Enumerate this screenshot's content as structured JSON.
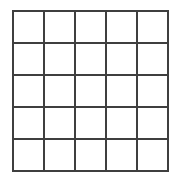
{
  "figure": {
    "name": "grid-figure",
    "type": "grid",
    "background_color": "#ffffff"
  },
  "chart_data": {
    "type": "table",
    "title": "",
    "subtitle": "",
    "xlabel": "",
    "ylabel": "",
    "rows": 5,
    "columns": 5,
    "cell_count": 25,
    "cell_values": [
      [
        "",
        "",
        "",
        "",
        ""
      ],
      [
        "",
        "",
        "",
        "",
        ""
      ],
      [
        "",
        "",
        "",
        "",
        ""
      ],
      [
        "",
        "",
        "",
        "",
        ""
      ],
      [
        "",
        "",
        "",
        "",
        ""
      ]
    ],
    "column_headers": [
      "",
      "",
      "",
      "",
      ""
    ],
    "row_headers": [
      "",
      "",
      "",
      "",
      ""
    ],
    "grid": "on",
    "legend": "none",
    "annotations": []
  },
  "geometry": {
    "canvas_width": 180,
    "canvas_height": 183,
    "left": 13,
    "top": 11,
    "right": 168,
    "bottom": 171,
    "cell_width": 31,
    "cell_height": 32,
    "vertical_line_x": [
      13,
      44,
      75,
      106,
      137,
      168
    ],
    "horizontal_line_y": [
      11,
      43,
      75,
      107,
      139,
      171
    ]
  },
  "style": {
    "line_color": "#3f3f3f",
    "line_width": 2,
    "cell_fill": "#ffffff",
    "canvas_fill": "#ffffff"
  }
}
